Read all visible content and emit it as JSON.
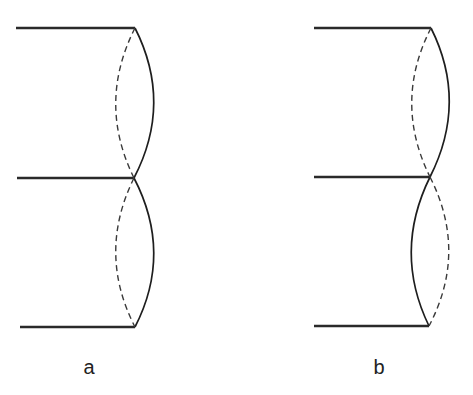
{
  "figure": {
    "panels": [
      {
        "label": "a",
        "upper_segment": {
          "front": "right-bulging solid",
          "back": "left-bulging dashed"
        },
        "lower_segment": {
          "front": "right-bulging solid",
          "back": "left-bulging dashed"
        }
      },
      {
        "label": "b",
        "upper_segment": {
          "front": "right-bulging solid",
          "back": "left-bulging dashed"
        },
        "lower_segment": {
          "front": "left-bulging solid",
          "back": "right-bulging dashed"
        }
      }
    ],
    "colors": {
      "line": "#1e1e1e",
      "background": "#ffffff"
    }
  }
}
